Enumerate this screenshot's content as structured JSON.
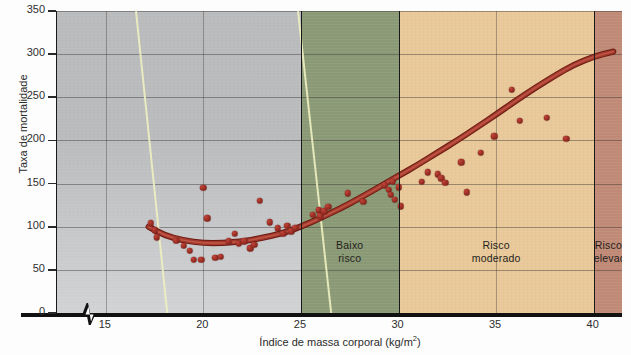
{
  "chart_data": {
    "type": "scatter",
    "title": "",
    "xlabel": "Índice de massa corporal (kg/m2)",
    "xlabel_base": "Índice de massa corporal (kg/m",
    "xlabel_sup": "2",
    "xlabel_tail": ")",
    "ylabel": "Taxa de mortalidade",
    "xlim": [
      12.5,
      41.5
    ],
    "ylim": [
      0,
      350
    ],
    "xticks": [
      15,
      20,
      25,
      30,
      35,
      40
    ],
    "yticks": [
      0,
      50,
      100,
      150,
      200,
      250,
      300,
      350
    ],
    "grid": true,
    "legend": "none",
    "axis_break_x": true,
    "bands": [
      {
        "label": "",
        "x0": 12.5,
        "x1": 25,
        "color": "#b9bbbd"
      },
      {
        "label": "Baixo risco",
        "x0": 25,
        "x1": 30,
        "color": "#8b9a76"
      },
      {
        "label": "Risco moderado",
        "x0": 30,
        "x1": 40,
        "color": "#e9c899"
      },
      {
        "label": "Risco elevado",
        "x0": 40,
        "x1": 41.5,
        "color": "#c08a76"
      }
    ],
    "points": [
      {
        "x": 17.3,
        "y": 104
      },
      {
        "x": 17.5,
        "y": 96
      },
      {
        "x": 17.6,
        "y": 88
      },
      {
        "x": 18.6,
        "y": 84
      },
      {
        "x": 19.0,
        "y": 78
      },
      {
        "x": 19.3,
        "y": 72
      },
      {
        "x": 19.5,
        "y": 62
      },
      {
        "x": 19.9,
        "y": 62
      },
      {
        "x": 20.0,
        "y": 145
      },
      {
        "x": 20.2,
        "y": 110
      },
      {
        "x": 20.6,
        "y": 64
      },
      {
        "x": 20.9,
        "y": 65
      },
      {
        "x": 21.3,
        "y": 83
      },
      {
        "x": 21.6,
        "y": 92
      },
      {
        "x": 21.8,
        "y": 80
      },
      {
        "x": 22.1,
        "y": 83
      },
      {
        "x": 22.4,
        "y": 75
      },
      {
        "x": 22.6,
        "y": 79
      },
      {
        "x": 22.9,
        "y": 130
      },
      {
        "x": 23.4,
        "y": 105
      },
      {
        "x": 23.8,
        "y": 98
      },
      {
        "x": 24.1,
        "y": 92
      },
      {
        "x": 24.3,
        "y": 101
      },
      {
        "x": 24.5,
        "y": 95
      },
      {
        "x": 24.7,
        "y": 99
      },
      {
        "x": 25.6,
        "y": 114
      },
      {
        "x": 25.9,
        "y": 119
      },
      {
        "x": 26.0,
        "y": 112
      },
      {
        "x": 26.2,
        "y": 118
      },
      {
        "x": 26.4,
        "y": 123
      },
      {
        "x": 27.4,
        "y": 139
      },
      {
        "x": 28.2,
        "y": 129
      },
      {
        "x": 29.3,
        "y": 148
      },
      {
        "x": 29.5,
        "y": 143
      },
      {
        "x": 29.6,
        "y": 137
      },
      {
        "x": 29.7,
        "y": 152
      },
      {
        "x": 29.8,
        "y": 131
      },
      {
        "x": 30.0,
        "y": 146
      },
      {
        "x": 30.1,
        "y": 124
      },
      {
        "x": 31.2,
        "y": 152
      },
      {
        "x": 31.5,
        "y": 163
      },
      {
        "x": 32.0,
        "y": 161
      },
      {
        "x": 32.2,
        "y": 156
      },
      {
        "x": 32.4,
        "y": 151
      },
      {
        "x": 33.2,
        "y": 175
      },
      {
        "x": 33.5,
        "y": 140
      },
      {
        "x": 34.2,
        "y": 186
      },
      {
        "x": 34.9,
        "y": 205
      },
      {
        "x": 35.8,
        "y": 259
      },
      {
        "x": 36.2,
        "y": 223
      },
      {
        "x": 37.6,
        "y": 226
      },
      {
        "x": 38.6,
        "y": 202
      }
    ],
    "trend_curve": {
      "description": "J-shaped mortality trend line",
      "points": [
        {
          "x": 17.2,
          "y": 100
        },
        {
          "x": 18.0,
          "y": 90
        },
        {
          "x": 19.0,
          "y": 84
        },
        {
          "x": 20.0,
          "y": 81
        },
        {
          "x": 21.0,
          "y": 81
        },
        {
          "x": 22.0,
          "y": 83
        },
        {
          "x": 23.0,
          "y": 87
        },
        {
          "x": 24.0,
          "y": 92
        },
        {
          "x": 25.0,
          "y": 100
        },
        {
          "x": 26.0,
          "y": 110
        },
        {
          "x": 27.0,
          "y": 121
        },
        {
          "x": 28.0,
          "y": 133
        },
        {
          "x": 29.0,
          "y": 146
        },
        {
          "x": 30.0,
          "y": 159
        },
        {
          "x": 31.0,
          "y": 172
        },
        {
          "x": 32.0,
          "y": 186
        },
        {
          "x": 33.0,
          "y": 200
        },
        {
          "x": 34.0,
          "y": 215
        },
        {
          "x": 35.0,
          "y": 230
        },
        {
          "x": 36.0,
          "y": 246
        },
        {
          "x": 37.0,
          "y": 261
        },
        {
          "x": 38.0,
          "y": 275
        },
        {
          "x": 39.0,
          "y": 288
        },
        {
          "x": 40.0,
          "y": 297
        },
        {
          "x": 41.0,
          "y": 303
        }
      ],
      "color": "#9e3529"
    },
    "point_color": "#9d2f25"
  }
}
